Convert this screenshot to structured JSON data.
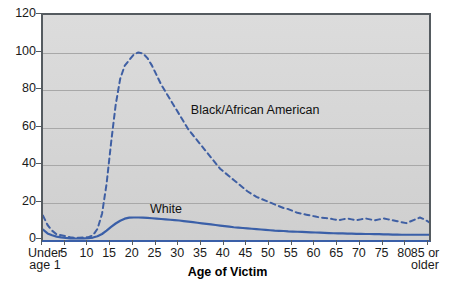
{
  "chart_data": {
    "type": "line",
    "title": "",
    "xlabel": "Age of Victim",
    "ylabel": "",
    "ylim": [
      0,
      120
    ],
    "yticks": [
      0,
      20,
      40,
      60,
      80,
      100,
      120
    ],
    "grid": true,
    "legend_position": "inline-annotation",
    "x_tick_labels": [
      "Under age 1",
      "5",
      "10",
      "15",
      "20",
      "25",
      "30",
      "35",
      "40",
      "45",
      "50",
      "55",
      "60",
      "65",
      "70",
      "75",
      "80",
      "85 or older"
    ],
    "x_tick_first_line1": "Under",
    "x_tick_first_line2": "age 1",
    "x_tick_last_line1": "85 or",
    "x_tick_last_line2": "older",
    "x": [
      0,
      1,
      2,
      3,
      4,
      5,
      6,
      7,
      8,
      9,
      10,
      11,
      12,
      13,
      14,
      15,
      16,
      17,
      18,
      19,
      20,
      21,
      22,
      23,
      24,
      25,
      26,
      27,
      28,
      29,
      30,
      31,
      32,
      33,
      34,
      35,
      36,
      37,
      38,
      39,
      40,
      41,
      42,
      43,
      44,
      45,
      46,
      47,
      48,
      49,
      50,
      51,
      52,
      53,
      54,
      55,
      56,
      57,
      58,
      59,
      60,
      61,
      62,
      63,
      64,
      65,
      66,
      67,
      68,
      69,
      70,
      71,
      72,
      73,
      74,
      75,
      76,
      77,
      78,
      79,
      80,
      81,
      82,
      83,
      84,
      85
    ],
    "series": [
      {
        "name": "Black/African American",
        "style": "dashed",
        "color": "#3f5fa3",
        "label_x_age": 33,
        "label_y_value": 72,
        "values": [
          13,
          8,
          5,
          3,
          2.5,
          2,
          1.5,
          1.2,
          1.2,
          1.3,
          1.5,
          2.5,
          6,
          14,
          30,
          52,
          72,
          86,
          93,
          96,
          99,
          100,
          99.5,
          97,
          93,
          88,
          83,
          79,
          75,
          71,
          67,
          63,
          59,
          56,
          53,
          50,
          47,
          44,
          41,
          38,
          36,
          34,
          32,
          30,
          28,
          26,
          24.5,
          23,
          22,
          21,
          20,
          19,
          18,
          17,
          16.5,
          15.5,
          14.5,
          14,
          13.5,
          13,
          12.5,
          12,
          11.8,
          11.5,
          11,
          10.5,
          11,
          11.5,
          11,
          10.5,
          11,
          11.5,
          11,
          10.5,
          11,
          11.5,
          11,
          10.5,
          10,
          9.5,
          9,
          10,
          11,
          12,
          11,
          9.5
        ]
      },
      {
        "name": "White",
        "style": "solid",
        "color": "#3a5fa8",
        "label_x_age": 24,
        "label_y_value": 19,
        "values": [
          5.5,
          3.5,
          2.5,
          1.8,
          1.4,
          1.1,
          0.9,
          0.8,
          0.8,
          0.9,
          1,
          1.3,
          2,
          3.2,
          5,
          7,
          8.8,
          10.3,
          11.4,
          11.9,
          12,
          12,
          11.9,
          11.8,
          11.6,
          11.4,
          11.2,
          11,
          10.8,
          10.6,
          10.4,
          10.1,
          9.8,
          9.5,
          9.2,
          8.9,
          8.6,
          8.3,
          8,
          7.7,
          7.4,
          7.1,
          6.8,
          6.6,
          6.4,
          6.2,
          6,
          5.8,
          5.6,
          5.4,
          5.2,
          5,
          4.9,
          4.8,
          4.6,
          4.5,
          4.4,
          4.3,
          4.2,
          4.1,
          4,
          3.9,
          3.8,
          3.7,
          3.6,
          3.5,
          3.5,
          3.4,
          3.4,
          3.3,
          3.3,
          3.2,
          3.2,
          3.1,
          3.1,
          3,
          3,
          2.9,
          2.9,
          2.8,
          2.8,
          2.8,
          2.8,
          2.8,
          2.8,
          2.8
        ]
      }
    ]
  },
  "axis": {
    "x_title": "Age of Victim"
  }
}
